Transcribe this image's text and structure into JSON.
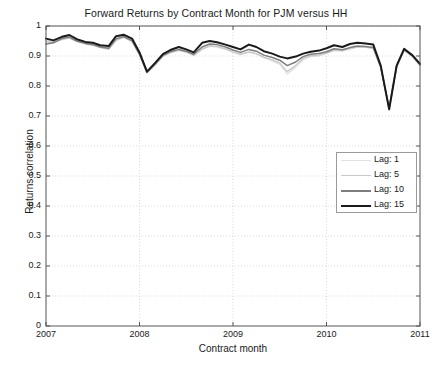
{
  "chart_data": {
    "type": "line",
    "title": "Forward Returns by Contract Month for PJM versus HH",
    "xlabel": "Contract month",
    "ylabel": "Returns correlation",
    "xlim": [
      2007,
      2011
    ],
    "ylim": [
      0,
      1
    ],
    "xticks": [
      "2007",
      "2008",
      "2009",
      "2010",
      "2011"
    ],
    "yticks": [
      "0",
      "0.1",
      "0.2",
      "0.3",
      "0.4",
      "0.5",
      "0.6",
      "0.7",
      "0.8",
      "0.9",
      "1"
    ],
    "grid": true,
    "legend_position": "center-right",
    "x": [
      2007.0,
      2007.08,
      2007.17,
      2007.25,
      2007.33,
      2007.42,
      2007.5,
      2007.58,
      2007.67,
      2007.75,
      2007.83,
      2007.92,
      2008.0,
      2008.08,
      2008.17,
      2008.25,
      2008.33,
      2008.42,
      2008.5,
      2008.58,
      2008.67,
      2008.75,
      2008.83,
      2008.92,
      2009.0,
      2009.08,
      2009.17,
      2009.25,
      2009.33,
      2009.42,
      2009.5,
      2009.58,
      2009.67,
      2009.75,
      2009.83,
      2009.92,
      2010.0,
      2010.08,
      2010.17,
      2010.25,
      2010.33,
      2010.42,
      2010.5,
      2010.58,
      2010.67,
      2010.75,
      2010.83,
      2010.92,
      2011.0
    ],
    "series": [
      {
        "name": "Lag: 1",
        "color": "#e2e2e2",
        "width": 1.3,
        "values": [
          0.952,
          0.949,
          0.957,
          0.962,
          0.951,
          0.944,
          0.94,
          0.932,
          0.927,
          0.955,
          0.964,
          0.95,
          0.905,
          0.845,
          0.872,
          0.9,
          0.912,
          0.92,
          0.914,
          0.903,
          0.922,
          0.932,
          0.93,
          0.922,
          0.912,
          0.905,
          0.912,
          0.907,
          0.894,
          0.884,
          0.872,
          0.84,
          0.862,
          0.888,
          0.898,
          0.9,
          0.908,
          0.918,
          0.916,
          0.923,
          0.93,
          0.929,
          0.925,
          0.86,
          0.73,
          0.862,
          0.918,
          0.898,
          0.868
        ]
      },
      {
        "name": "Lag: 5",
        "color": "#c9c9c9",
        "width": 1.4,
        "values": [
          0.948,
          0.946,
          0.955,
          0.96,
          0.948,
          0.941,
          0.936,
          0.928,
          0.922,
          0.952,
          0.962,
          0.948,
          0.903,
          0.843,
          0.871,
          0.899,
          0.911,
          0.919,
          0.913,
          0.902,
          0.923,
          0.934,
          0.932,
          0.924,
          0.914,
          0.906,
          0.914,
          0.908,
          0.896,
          0.887,
          0.877,
          0.848,
          0.868,
          0.892,
          0.901,
          0.903,
          0.91,
          0.92,
          0.918,
          0.925,
          0.931,
          0.93,
          0.926,
          0.862,
          0.727,
          0.864,
          0.919,
          0.899,
          0.869
        ]
      },
      {
        "name": "Lag: 10",
        "color": "#7d7d7d",
        "width": 1.5,
        "values": [
          0.94,
          0.944,
          0.958,
          0.963,
          0.95,
          0.942,
          0.938,
          0.93,
          0.926,
          0.957,
          0.965,
          0.951,
          0.906,
          0.846,
          0.874,
          0.902,
          0.914,
          0.922,
          0.916,
          0.906,
          0.93,
          0.94,
          0.938,
          0.93,
          0.92,
          0.912,
          0.922,
          0.916,
          0.903,
          0.895,
          0.886,
          0.868,
          0.88,
          0.898,
          0.906,
          0.908,
          0.914,
          0.924,
          0.921,
          0.928,
          0.933,
          0.932,
          0.928,
          0.864,
          0.725,
          0.866,
          0.921,
          0.9,
          0.871
        ]
      },
      {
        "name": "Lag: 15",
        "color": "#1a1a1a",
        "width": 2.0,
        "values": [
          0.958,
          0.952,
          0.964,
          0.97,
          0.956,
          0.947,
          0.944,
          0.936,
          0.933,
          0.966,
          0.971,
          0.958,
          0.912,
          0.848,
          0.878,
          0.906,
          0.92,
          0.93,
          0.922,
          0.912,
          0.944,
          0.95,
          0.946,
          0.938,
          0.93,
          0.922,
          0.938,
          0.93,
          0.916,
          0.908,
          0.898,
          0.892,
          0.898,
          0.908,
          0.914,
          0.918,
          0.926,
          0.936,
          0.93,
          0.94,
          0.944,
          0.942,
          0.938,
          0.868,
          0.722,
          0.868,
          0.924,
          0.902,
          0.874
        ]
      }
    ]
  },
  "axes": {
    "plot_left": 46,
    "plot_right": 420,
    "plot_top": 26,
    "plot_bottom": 326
  }
}
